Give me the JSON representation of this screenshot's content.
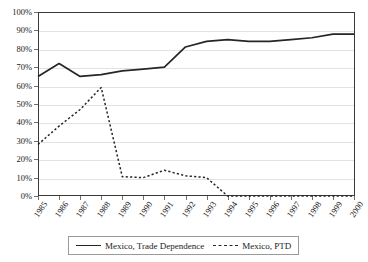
{
  "chart_data": {
    "type": "line",
    "title": "",
    "subtitle": "",
    "xlabel": "",
    "ylabel": "",
    "grid": "horizontal",
    "legend_position": "bottom",
    "ylim": [
      0,
      100
    ],
    "y_unit": "%",
    "y_tick_labels": [
      "0%",
      "10%",
      "20%",
      "30%",
      "40%",
      "50%",
      "60%",
      "70%",
      "80%",
      "90%",
      "100%"
    ],
    "y_tick_values": [
      0,
      10,
      20,
      30,
      40,
      50,
      60,
      70,
      80,
      90,
      100
    ],
    "categories": [
      "1985",
      "1986",
      "1987",
      "1988",
      "1989",
      "1990",
      "1991",
      "1992",
      "1993",
      "1994",
      "1995",
      "1996",
      "1997",
      "1998",
      "1999",
      "2000"
    ],
    "x": [
      1985,
      1986,
      1987,
      1988,
      1989,
      1990,
      1991,
      1992,
      1993,
      1994,
      1995,
      1996,
      1997,
      1998,
      1999,
      2000
    ],
    "series": [
      {
        "name": "Mexico, Trade Dependence",
        "style": "solid",
        "color": "#262626",
        "values": [
          65,
          72,
          65,
          66,
          68,
          69,
          70,
          81,
          84,
          85,
          84,
          84,
          85,
          86,
          88,
          88
        ]
      },
      {
        "name": "Mexico, PTD",
        "style": "dashed",
        "color": "#262626",
        "values": [
          28,
          38,
          47,
          59,
          10.5,
          10,
          14,
          11,
          10,
          0,
          0,
          0,
          0,
          0,
          0,
          0
        ]
      }
    ]
  },
  "legend": {
    "entries": [
      {
        "label": "Mexico, Trade Dependence",
        "style": "solid"
      },
      {
        "label": "Mexico, PTD",
        "style": "dashed"
      }
    ]
  },
  "colors": {
    "series_line": "#262626",
    "gridline": "#e2e2e2",
    "plot_border": "#3a3a3a",
    "text": "#1a1a1a",
    "background": "#ffffff"
  }
}
